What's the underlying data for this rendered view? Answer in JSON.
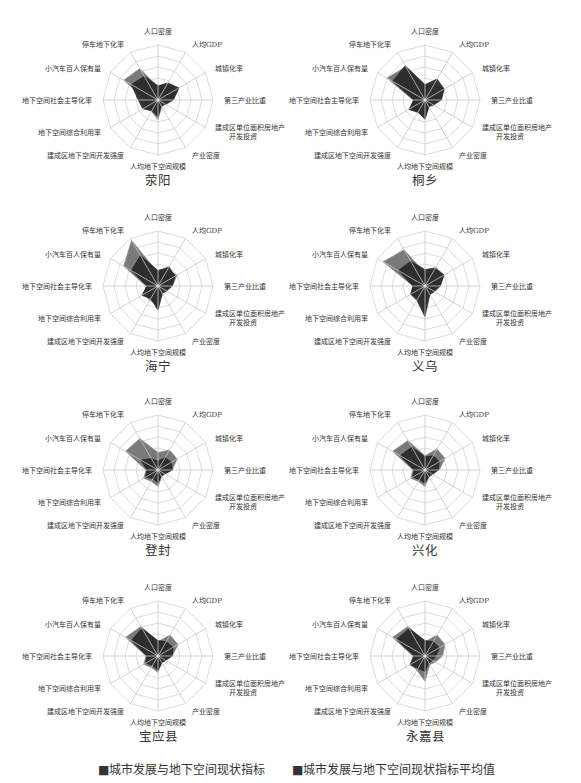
{
  "chart_data": {
    "type": "radar",
    "axes": [
      "人口密度",
      "人均GDP",
      "城镇化率",
      "第三产业比重",
      "建成区单位面积房地产开发投资",
      "产业密度",
      "人均地下空间规模",
      "建成区地下空间开发强度",
      "地下空间综合利用率",
      "地下空间社会主导化率",
      "小汽车百人保有量",
      "停车地下化率"
    ],
    "axis_label_lines": [
      [
        "人口密度"
      ],
      [
        "人均GDP"
      ],
      [
        "城镇化率"
      ],
      [
        "第三产业比重"
      ],
      [
        "建成区单位面积房地产",
        "开发投资"
      ],
      [
        "产业密度"
      ],
      [
        "人均地下空间规模"
      ],
      [
        "建成区地下空间开发强度"
      ],
      [
        "地下空间综合利用率"
      ],
      [
        "地下空间社会主导化率"
      ],
      [
        "小汽车百人保有量"
      ],
      [
        "停车地下化率"
      ]
    ],
    "rings": 5,
    "scale_max": 5,
    "grid": true,
    "legend_position": "bottom",
    "series_names": [
      "城市发展与地下空间现状指标",
      "城市发展与地下空间现状指标平均值"
    ],
    "colors": {
      "current": "#2a2a2a",
      "average": "#7a7a7a",
      "grid": "#dcdcdc",
      "spoke": "#c8c8c8"
    },
    "charts": [
      {
        "city": "荥阳",
        "cx": 158,
        "cy": 100,
        "current": [
          1.3,
          1.8,
          2.2,
          1.4,
          0.8,
          0.6,
          1.5,
          1.1,
          1.6,
          1.8,
          2.8,
          2.5
        ],
        "average": [
          1.2,
          1.7,
          2.0,
          1.3,
          0.7,
          0.7,
          1.8,
          1.2,
          1.5,
          1.1,
          3.6,
          3.3
        ]
      },
      {
        "city": "桐乡",
        "cx": 425,
        "cy": 100,
        "current": [
          1.4,
          2.2,
          2.0,
          1.5,
          0.9,
          0.7,
          1.7,
          1.3,
          1.7,
          1.0,
          3.4,
          3.6
        ],
        "average": [
          1.2,
          1.7,
          2.0,
          1.3,
          0.7,
          0.7,
          1.8,
          1.2,
          1.5,
          1.1,
          4.0,
          3.5
        ]
      },
      {
        "city": "海宁",
        "cx": 158,
        "cy": 286,
        "current": [
          1.4,
          2.0,
          1.8,
          1.3,
          0.9,
          0.8,
          2.2,
          1.3,
          1.7,
          1.0,
          2.8,
          3.2
        ],
        "average": [
          1.2,
          1.7,
          2.0,
          1.3,
          0.7,
          0.7,
          1.8,
          1.5,
          1.5,
          1.1,
          3.6,
          4.8
        ]
      },
      {
        "city": "义乌",
        "cx": 425,
        "cy": 286,
        "current": [
          1.5,
          1.9,
          2.0,
          1.4,
          1.0,
          0.9,
          2.8,
          1.5,
          1.5,
          1.1,
          2.8,
          2.6
        ],
        "average": [
          1.2,
          1.7,
          2.0,
          1.3,
          0.7,
          0.7,
          2.2,
          1.3,
          1.5,
          1.1,
          4.4,
          3.8
        ]
      },
      {
        "city": "登封",
        "cx": 158,
        "cy": 470,
        "current": [
          0.8,
          1.3,
          1.4,
          1.3,
          0.7,
          0.6,
          1.2,
          0.9,
          1.3,
          1.0,
          1.8,
          1.2
        ],
        "average": [
          1.6,
          2.1,
          2.0,
          1.3,
          0.7,
          0.7,
          1.5,
          1.2,
          1.5,
          1.1,
          3.4,
          3.3
        ]
      },
      {
        "city": "兴化",
        "cx": 425,
        "cy": 470,
        "current": [
          1.2,
          1.5,
          1.5,
          1.2,
          0.8,
          0.7,
          1.2,
          1.0,
          1.3,
          1.0,
          2.6,
          2.4
        ],
        "average": [
          1.3,
          2.2,
          2.1,
          1.3,
          0.7,
          0.7,
          1.5,
          1.2,
          1.5,
          1.1,
          3.4,
          3.1
        ]
      },
      {
        "city": "宝应县",
        "cx": 158,
        "cy": 656,
        "current": [
          1.4,
          1.5,
          1.6,
          1.3,
          0.8,
          0.7,
          1.3,
          1.0,
          1.3,
          1.0,
          2.8,
          2.9
        ],
        "average": [
          1.3,
          2.2,
          2.1,
          1.3,
          0.7,
          0.7,
          1.5,
          1.2,
          1.5,
          1.1,
          3.4,
          3.1
        ]
      },
      {
        "city": "永嘉县",
        "cx": 425,
        "cy": 656,
        "current": [
          1.4,
          1.5,
          1.5,
          1.0,
          0.8,
          0.7,
          1.4,
          1.3,
          1.6,
          1.0,
          3.0,
          2.9
        ],
        "average": [
          1.3,
          2.2,
          2.1,
          1.6,
          1.1,
          0.9,
          2.3,
          1.5,
          1.5,
          1.1,
          3.4,
          3.1
        ]
      }
    ],
    "radius": 55
  },
  "legend": {
    "items": [
      {
        "label": "■城市发展与地下空间现状指标",
        "x": 98
      },
      {
        "label": "■城市发展与地下空间现状指标平均值",
        "x": 292
      }
    ]
  }
}
